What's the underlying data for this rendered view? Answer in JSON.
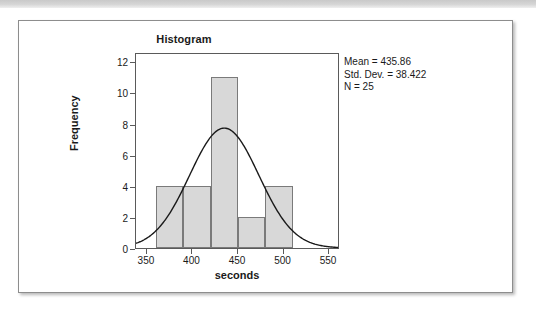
{
  "figure": {
    "title": "Histogram",
    "x_axis_title": "seconds",
    "y_axis_title": "Frequency",
    "stats": {
      "mean": "Mean = 435.86",
      "std_dev": "Std. Dev. = 38.422",
      "n": "N = 25"
    }
  },
  "chart_data": {
    "type": "bar",
    "title": "Histogram",
    "xlabel": "seconds",
    "ylabel": "Frequency",
    "xlim": [
      338,
      562
    ],
    "ylim": [
      0,
      12.6
    ],
    "grid": false,
    "legend": null,
    "bin_width": 30,
    "bin_edges": [
      360,
      390,
      420,
      450,
      480,
      510
    ],
    "categories": [
      "360-390",
      "390-420",
      "420-450",
      "450-480",
      "480-510"
    ],
    "values": [
      4,
      4,
      11,
      2,
      4
    ],
    "x_ticks": [
      350,
      400,
      450,
      500,
      550
    ],
    "x_tick_labels": [
      "350",
      "400",
      "450",
      "500",
      "550"
    ],
    "y_ticks": [
      0,
      2,
      4,
      6,
      8,
      10,
      12
    ],
    "y_tick_labels": [
      "0",
      "2",
      "4",
      "6",
      "8",
      "10",
      "12"
    ],
    "bar_fill_color": "#d8d8d8",
    "bar_edge_color": "#7a7a7a",
    "overlay": {
      "type": "line",
      "name": "normal curve",
      "color": "#1a1a1a",
      "mean": 435.86,
      "std_dev": 38.422,
      "n": 25,
      "scale_note": "normal density scaled by N * bin_width"
    },
    "annotations": [
      "Mean = 435.86",
      "Std. Dev. = 38.422",
      "N = 25"
    ]
  }
}
